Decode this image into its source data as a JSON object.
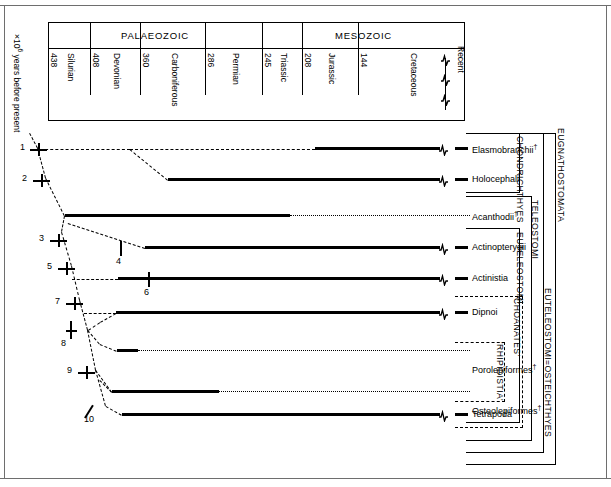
{
  "axis": {
    "caption_prefix": "×10",
    "caption_exp": "6",
    "caption_suffix": " years before present",
    "recent_label": "Recent"
  },
  "timescale": {
    "eras": [
      {
        "name": "PALAEOZOIC"
      },
      {
        "name": "MESOZOIC"
      }
    ],
    "periods": [
      {
        "name": "",
        "boundary": "438"
      },
      {
        "name": "Silurian",
        "boundary": "408"
      },
      {
        "name": "Devonian",
        "boundary": "360"
      },
      {
        "name": "Carboniferous",
        "boundary": "286"
      },
      {
        "name": "Permian",
        "boundary": "245"
      },
      {
        "name": "Triassic",
        "boundary": "208"
      },
      {
        "name": "Jurassic",
        "boundary": "144"
      },
      {
        "name": "Cretaceous",
        "boundary": ""
      }
    ],
    "period_names": [
      "Silurian",
      "Devonian",
      "Carboniferous",
      "Permian",
      "Triassic",
      "Jurassic",
      "Cretaceous"
    ],
    "boundaries": [
      "438",
      "408",
      "360",
      "286",
      "245",
      "208",
      "144"
    ]
  },
  "taxa": [
    {
      "label": "Elasmobranchii",
      "dagger": "†",
      "extant": true
    },
    {
      "label": "Holocephali",
      "dagger": "",
      "extant": true
    },
    {
      "label": "Acanthodii",
      "dagger": "†",
      "extant": false
    },
    {
      "label": "Actinopterygii",
      "dagger": "",
      "extant": true
    },
    {
      "label": "Actinistia",
      "dagger": "",
      "extant": true
    },
    {
      "label": "Dipnoi",
      "dagger": "",
      "extant": true
    },
    {
      "label": "Porolepiformes",
      "dagger": "†",
      "extant": false
    },
    {
      "label": "Osteolepiformes",
      "dagger": "†",
      "extant": false
    },
    {
      "label": "Tetrapoda",
      "dagger": "",
      "extant": true
    }
  ],
  "nodes": [
    {
      "id": "1"
    },
    {
      "id": "2"
    },
    {
      "id": "3"
    },
    {
      "id": "4"
    },
    {
      "id": "5"
    },
    {
      "id": "6"
    },
    {
      "id": "7"
    },
    {
      "id": "8"
    },
    {
      "id": "9"
    },
    {
      "id": "10"
    }
  ],
  "clades": [
    {
      "name": "CHONDRICHTHYES",
      "style": "solid"
    },
    {
      "name": "TELEOSTOMI",
      "style": "solid"
    },
    {
      "name": "EUTELEOSTOMI",
      "style": "solid"
    },
    {
      "name": "EUTELEOSTOMI=OSTEICHTHYES",
      "style": "solid"
    },
    {
      "name": "EUGNATHOSTOMATA",
      "style": "solid"
    },
    {
      "name": "'CHOANATES'",
      "style": "dashed"
    },
    {
      "name": "'RHIPIDISTIA'",
      "style": "dashed"
    }
  ],
  "chart_data": {
    "type": "range-chart",
    "xlabel": "×10⁶ years before present",
    "x_axis_boundaries_mya": [
      438,
      408,
      360,
      286,
      245,
      208,
      144,
      0
    ],
    "periods": [
      "Silurian",
      "Devonian",
      "Carboniferous",
      "Permian",
      "Triassic",
      "Jurassic",
      "Cretaceous",
      "Recent"
    ],
    "eras": [
      "PALAEOZOIC",
      "MESOZOIC"
    ],
    "ranges": [
      {
        "taxon": "Elasmobranchii",
        "solid_start_px": 315,
        "solid_end_px": 440,
        "dotted": false,
        "extant": true,
        "extinct_marker": "†"
      },
      {
        "taxon": "Holocephali",
        "solid_start_px": 168,
        "solid_end_px": 440,
        "dotted": false,
        "extant": true,
        "extinct_marker": ""
      },
      {
        "taxon": "Acanthodii",
        "solid_start_px": 65,
        "solid_end_px": 290,
        "dotted_end_px": 470,
        "dotted": true,
        "extant": false,
        "extinct_marker": "†"
      },
      {
        "taxon": "Actinopterygii",
        "solid_start_px": 145,
        "solid_end_px": 440,
        "dotted": false,
        "extant": true,
        "extinct_marker": ""
      },
      {
        "taxon": "Actinistia",
        "solid_start_px": 118,
        "solid_end_px": 440,
        "dotted": false,
        "extant": true,
        "extinct_marker": ""
      },
      {
        "taxon": "Dipnoi",
        "solid_start_px": 116,
        "solid_end_px": 440,
        "dotted": false,
        "extant": true,
        "extinct_marker": ""
      },
      {
        "taxon": "Porolepiformes",
        "solid_start_px": 117,
        "solid_end_px": 138,
        "dotted_end_px": 470,
        "dotted": true,
        "extant": false,
        "extinct_marker": "†"
      },
      {
        "taxon": "Osteolepiformes",
        "solid_start_px": 112,
        "solid_end_px": 219,
        "dotted_end_px": 470,
        "dotted": true,
        "extant": false,
        "extinct_marker": "†"
      },
      {
        "taxon": "Tetrapoda",
        "solid_start_px": 122,
        "solid_end_px": 440,
        "dotted": false,
        "extant": true,
        "extinct_marker": ""
      }
    ]
  }
}
